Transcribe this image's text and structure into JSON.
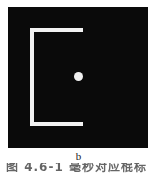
{
  "figure": {
    "panel_background": "#0a0a0a",
    "stroke_color": "#f2f2f2",
    "shapes": {
      "bracket_name": "u-shaped-bracket",
      "dot_name": "center-dot"
    }
  },
  "subfigure": {
    "label": "b"
  },
  "caption": {
    "text": "图 4.6-1  毫秒对应棍标"
  }
}
